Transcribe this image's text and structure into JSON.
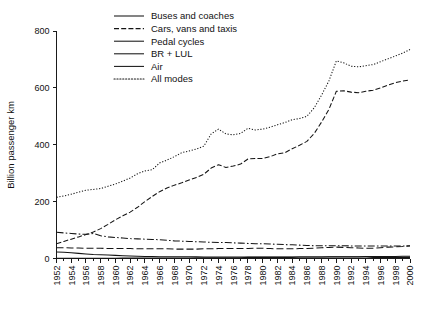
{
  "chart_data": {
    "type": "line",
    "title": "",
    "xlabel": "",
    "ylabel": "Billion passenger km",
    "xlim": [
      1952,
      2000
    ],
    "ylim": [
      0,
      800
    ],
    "yticks": [
      0,
      200,
      400,
      600,
      800
    ],
    "ytick_labels": [
      "0",
      "200",
      "400",
      "600",
      "800"
    ],
    "xticks": [
      1952,
      1954,
      1956,
      1958,
      1960,
      1962,
      1964,
      1966,
      1968,
      1970,
      1972,
      1974,
      1976,
      1978,
      1980,
      1982,
      1984,
      1986,
      1988,
      1990,
      1992,
      1994,
      1996,
      1998,
      2000
    ],
    "xtick_labels": [
      "1952",
      "1954",
      "1956",
      "1958",
      "1960",
      "1962",
      "1964",
      "1966",
      "1968",
      "1970",
      "1972",
      "1974",
      "1976",
      "1978",
      "1980",
      "1982",
      "1984",
      "1986",
      "1988",
      "1990",
      "1992",
      "1994",
      "1996",
      "1998",
      "2000"
    ],
    "xtick_rotation": 90,
    "grid": false,
    "legend_position": "top-center-left",
    "legend_frame": false,
    "x": [
      1952,
      1953,
      1954,
      1955,
      1956,
      1957,
      1958,
      1959,
      1960,
      1961,
      1962,
      1963,
      1964,
      1965,
      1966,
      1967,
      1968,
      1969,
      1970,
      1971,
      1972,
      1973,
      1974,
      1975,
      1976,
      1977,
      1978,
      1979,
      1980,
      1981,
      1982,
      1983,
      1984,
      1985,
      1986,
      1987,
      1988,
      1989,
      1990,
      1991,
      1992,
      1993,
      1994,
      1995,
      1996,
      1997,
      1998,
      1999,
      2000
    ],
    "series": [
      {
        "name": "Buses and coaches",
        "line_style": "dash-dot",
        "values": [
          92,
          90,
          88,
          86,
          85,
          88,
          80,
          76,
          74,
          72,
          70,
          69,
          68,
          67,
          66,
          64,
          62,
          61,
          60,
          59,
          58,
          57,
          56,
          56,
          55,
          54,
          53,
          52,
          52,
          51,
          50,
          49,
          48,
          47,
          46,
          45,
          45,
          45,
          45,
          45,
          44,
          44,
          44,
          44,
          44,
          44,
          44,
          44,
          44
        ]
      },
      {
        "name": "Cars, vans and taxis",
        "line_style": "dashed",
        "values": [
          52,
          60,
          68,
          76,
          84,
          93,
          105,
          120,
          136,
          150,
          163,
          180,
          200,
          218,
          235,
          248,
          258,
          266,
          276,
          285,
          296,
          318,
          330,
          320,
          325,
          332,
          350,
          352,
          352,
          358,
          368,
          372,
          386,
          398,
          412,
          440,
          480,
          525,
          588,
          590,
          585,
          583,
          588,
          592,
          600,
          610,
          618,
          624,
          628
        ]
      },
      {
        "name": "Pedal cycles",
        "line_style": "solid",
        "values": [
          23,
          22,
          20,
          18,
          16,
          14,
          13,
          12,
          11,
          10,
          9,
          8,
          7,
          7,
          6,
          6,
          6,
          6,
          6,
          6,
          5,
          5,
          5,
          5,
          5,
          5,
          5,
          5,
          5,
          5,
          5,
          5,
          5,
          5,
          5,
          5,
          5,
          5,
          5,
          5,
          5,
          5,
          5,
          4,
          4,
          4,
          4,
          4,
          4
        ]
      },
      {
        "name": "BR + LUL",
        "line_style": "dashed-long",
        "values": [
          38,
          38,
          37,
          37,
          36,
          36,
          36,
          35,
          35,
          35,
          35,
          34,
          34,
          34,
          34,
          34,
          33,
          33,
          33,
          33,
          34,
          34,
          35,
          35,
          35,
          35,
          35,
          36,
          36,
          35,
          34,
          34,
          34,
          35,
          35,
          36,
          38,
          39,
          40,
          39,
          38,
          37,
          36,
          36,
          38,
          40,
          41,
          42,
          45
        ]
      },
      {
        "name": "Air",
        "line_style": "solid-thin",
        "values": [
          1,
          1,
          1,
          1,
          1,
          1,
          1,
          1,
          1,
          2,
          2,
          2,
          2,
          2,
          2,
          2,
          2,
          2,
          2,
          3,
          3,
          3,
          3,
          3,
          3,
          3,
          4,
          4,
          4,
          4,
          4,
          4,
          4,
          5,
          5,
          5,
          5,
          6,
          6,
          6,
          6,
          6,
          7,
          7,
          7,
          7,
          7,
          8,
          8
        ]
      },
      {
        "name": "All modes",
        "line_style": "dotted",
        "values": [
          215,
          220,
          226,
          233,
          240,
          243,
          246,
          254,
          262,
          272,
          283,
          298,
          308,
          312,
          336,
          346,
          358,
          372,
          378,
          385,
          395,
          438,
          455,
          438,
          435,
          440,
          458,
          452,
          455,
          462,
          470,
          478,
          488,
          492,
          500,
          530,
          575,
          625,
          695,
          688,
          676,
          674,
          678,
          682,
          692,
          702,
          712,
          722,
          735
        ]
      }
    ]
  },
  "legend": {
    "items": [
      {
        "label": "Buses and coaches",
        "style": "solid"
      },
      {
        "label": "Cars, vans and taxis",
        "style": "dashed"
      },
      {
        "label": "Pedal cycles",
        "style": "solid"
      },
      {
        "label": "BR + LUL",
        "style": "solid"
      },
      {
        "label": "Air",
        "style": "solid"
      },
      {
        "label": "All modes",
        "style": "dotted"
      }
    ]
  }
}
